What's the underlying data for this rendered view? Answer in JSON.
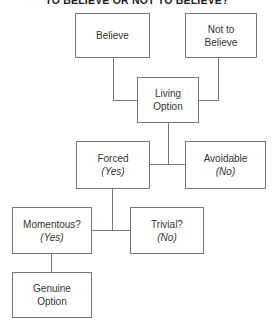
{
  "title": "TO BELIEVE OR NOT TO BELIEVE?",
  "colors": {
    "line": "#777777",
    "text": "#333333",
    "background": "#ffffff"
  },
  "nodes": {
    "believe": {
      "label": "Believe"
    },
    "not_believe": {
      "label": "Not to Believe",
      "line1": "Not to",
      "line2": "Believe"
    },
    "living_option": {
      "label": "Living Option",
      "line1": "Living",
      "line2": "Option"
    },
    "forced": {
      "label": "Forced",
      "sub": "(Yes)"
    },
    "avoidable": {
      "label": "Avoidable",
      "sub": "(No)"
    },
    "momentous": {
      "label": "Momentous?",
      "sub": "(Yes)"
    },
    "trivial": {
      "label": "Trivial?",
      "sub": "(No)"
    },
    "genuine_option": {
      "label": "Genuine Option",
      "line1": "Genuine",
      "line2": "Option"
    }
  },
  "edges": [
    [
      "believe",
      "living_option"
    ],
    [
      "not_believe",
      "living_option"
    ],
    [
      "living_option",
      "forced"
    ],
    [
      "living_option",
      "avoidable"
    ],
    [
      "forced",
      "momentous"
    ],
    [
      "forced",
      "trivial"
    ],
    [
      "momentous",
      "genuine_option"
    ]
  ]
}
